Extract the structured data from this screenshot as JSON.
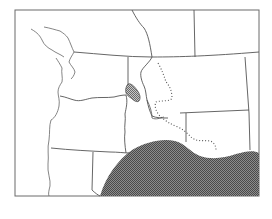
{
  "map": {
    "title": "",
    "region": "Pacific Northwest, USA",
    "colors": {
      "background": "#ffffff",
      "borders": "#555555",
      "shaded_region": "#6e6e6e",
      "hatched_region": "#8a8a8a"
    },
    "features": [
      {
        "name": "state-borders",
        "style": "solid line"
      },
      {
        "name": "coastline",
        "style": "solid line"
      },
      {
        "name": "rivers",
        "style": "solid line"
      },
      {
        "name": "dotted-boundary",
        "style": "dotted line"
      },
      {
        "name": "small-hatched-area",
        "style": "hatched fill"
      },
      {
        "name": "large-shaded-area",
        "style": "dense stipple fill"
      }
    ],
    "labels": []
  }
}
